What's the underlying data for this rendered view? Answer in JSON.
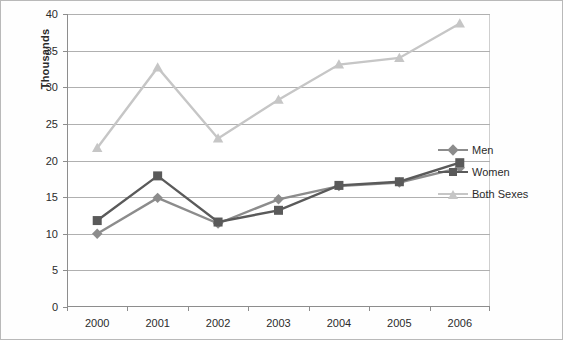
{
  "chart_data": {
    "type": "line",
    "title": "",
    "xlabel": "",
    "ylabel": "Thousands",
    "categories": [
      "2000",
      "2001",
      "2002",
      "2003",
      "2004",
      "2005",
      "2006"
    ],
    "ylim": [
      0,
      40
    ],
    "yticks": [
      0,
      5,
      10,
      15,
      20,
      25,
      30,
      35,
      40
    ],
    "grid": true,
    "legend_position": "right",
    "series": [
      {
        "name": "Men",
        "marker": "diamond",
        "color": "#8c8c8c",
        "values": [
          10.0,
          14.9,
          11.4,
          14.7,
          16.5,
          17.0,
          19.0
        ]
      },
      {
        "name": "Women",
        "marker": "square",
        "color": "#5a5a5a",
        "values": [
          11.8,
          17.9,
          11.6,
          13.2,
          16.6,
          17.1,
          19.7
        ]
      },
      {
        "name": "Both Sexes",
        "marker": "triangle",
        "color": "#c6c6c6",
        "values": [
          21.7,
          32.7,
          23.0,
          28.3,
          33.1,
          34.0,
          38.7
        ]
      }
    ]
  },
  "axis": {
    "y_title": "Thousands"
  },
  "legend": {
    "items": [
      {
        "label": "Men"
      },
      {
        "label": "Women"
      },
      {
        "label": "Both Sexes"
      }
    ]
  }
}
